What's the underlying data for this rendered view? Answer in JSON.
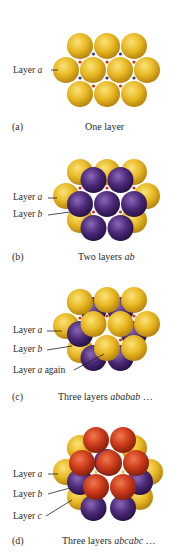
{
  "colors": {
    "layer_a": "#e8b923",
    "layer_b": "#4b2a78",
    "layer_c": "#cc3a1a",
    "hole_dot_blue": "#3b3a8a",
    "hole_dot_red": "#cc3a1a"
  },
  "panels": [
    {
      "letter": "(a)",
      "caption_prefix": "One layer",
      "caption_italic": "",
      "caption_suffix": "",
      "labels": [
        {
          "prefix": "Layer ",
          "italic": "a",
          "suffix": ""
        }
      ]
    },
    {
      "letter": "(b)",
      "caption_prefix": "Two layers ",
      "caption_italic": "ab",
      "caption_suffix": "",
      "labels": [
        {
          "prefix": "Layer ",
          "italic": "a",
          "suffix": ""
        },
        {
          "prefix": "Layer ",
          "italic": "b",
          "suffix": ""
        }
      ]
    },
    {
      "letter": "(c)",
      "caption_prefix": "Three layers ",
      "caption_italic": "ababab",
      "caption_suffix": " …",
      "labels": [
        {
          "prefix": "Layer ",
          "italic": "a",
          "suffix": ""
        },
        {
          "prefix": "Layer ",
          "italic": "b",
          "suffix": ""
        },
        {
          "prefix": "Layer ",
          "italic": "a",
          "suffix": " again"
        }
      ]
    },
    {
      "letter": "(d)",
      "caption_prefix": "Three layers ",
      "caption_italic": "abcabc",
      "caption_suffix": " …",
      "labels": [
        {
          "prefix": "Layer ",
          "italic": "a",
          "suffix": ""
        },
        {
          "prefix": "Layer ",
          "italic": "b",
          "suffix": ""
        },
        {
          "prefix": "Layer ",
          "italic": "c",
          "suffix": ""
        }
      ]
    }
  ]
}
